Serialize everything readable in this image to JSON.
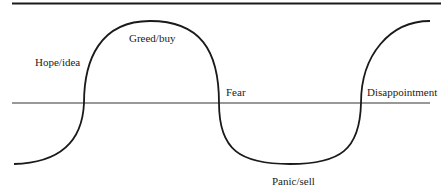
{
  "diagram": {
    "title": "",
    "labels": {
      "hope": "Hope/idea",
      "greed": "Greed/buy",
      "fear": "Fear",
      "disappointment": "Disappointment",
      "panic": "Panic/sell"
    },
    "colors": {
      "curve": "#1a1a1a",
      "top_rule": "#1a1a1a",
      "baseline": "#333333",
      "text": "#222222",
      "background": "#ffffff"
    }
  }
}
